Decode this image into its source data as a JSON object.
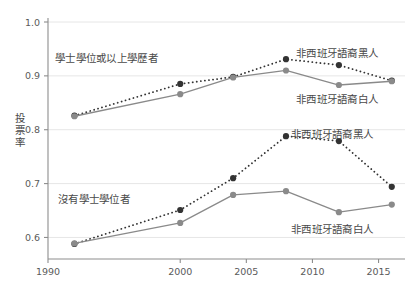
{
  "chart_data": {
    "type": "line",
    "title": "",
    "xlabel": "",
    "ylabel": "投票率",
    "xlim": [
      1990,
      2017
    ],
    "ylim": [
      0.56,
      1.0
    ],
    "xticks": [
      1990,
      2000,
      2005,
      2010,
      2015
    ],
    "xticklabels": [
      "1990",
      "2000",
      "2005",
      "2010",
      "2015"
    ],
    "yticks": [
      0.6,
      0.7,
      0.8,
      0.9,
      1.0
    ],
    "yticklabels": [
      "0.6",
      "0.7",
      "0.8",
      "0.9",
      "1.0"
    ],
    "grid": "horizontal-light",
    "legend_position": "inline-annotations",
    "x": [
      1992,
      2000,
      2004,
      2008,
      2012,
      2016
    ],
    "series": [
      {
        "name": "學士學位或以上學歷者 · 非西班牙語裔黑人",
        "group": "bachelor-or-higher",
        "race": "non-hispanic-black",
        "style": "dotted",
        "color": "#333333",
        "values": [
          0.826,
          0.885,
          0.898,
          0.931,
          0.92,
          0.891
        ]
      },
      {
        "name": "學士學位或以上學歷者 · 非西班牙語裔白人",
        "group": "bachelor-or-higher",
        "race": "non-hispanic-white",
        "style": "solid",
        "color": "#8a8a8a",
        "values": [
          0.825,
          0.866,
          0.897,
          0.91,
          0.883,
          0.89
        ]
      },
      {
        "name": "沒有學士學位者 · 非西班牙語裔黑人",
        "group": "no-bachelor",
        "race": "non-hispanic-black",
        "style": "dotted",
        "color": "#333333",
        "values": [
          0.588,
          0.651,
          0.71,
          0.788,
          0.779,
          0.694
        ]
      },
      {
        "name": "沒有學士學位者 · 非西班牙語裔白人",
        "group": "no-bachelor",
        "race": "non-hispanic-white",
        "style": "solid",
        "color": "#8a8a8a",
        "values": [
          0.589,
          0.627,
          0.679,
          0.686,
          0.647,
          0.661
        ]
      }
    ],
    "annotations": [
      {
        "id": "group-upper",
        "text": "學士學位或以上學歷者",
        "x_px": 55,
        "y_px": 50
      },
      {
        "id": "upper-black",
        "text": "非西班牙語裔黑人",
        "x_px": 296,
        "y_px": 45
      },
      {
        "id": "upper-white",
        "text": "非西班牙語裔白人",
        "x_px": 296,
        "y_px": 91
      },
      {
        "id": "lower-black",
        "text": "非西班牙語裔黑人",
        "x_px": 291,
        "y_px": 126
      },
      {
        "id": "group-lower",
        "text": "沒有學士學位者",
        "x_px": 58,
        "y_px": 191
      },
      {
        "id": "lower-white",
        "text": "非西班牙語裔白人",
        "x_px": 291,
        "y_px": 221
      }
    ],
    "colors": {
      "black_series": "#333333",
      "white_series": "#8a8a8a",
      "axis": "#8d8d8d",
      "grid": "#e6e6e6",
      "text": "#4a4a4a"
    }
  }
}
